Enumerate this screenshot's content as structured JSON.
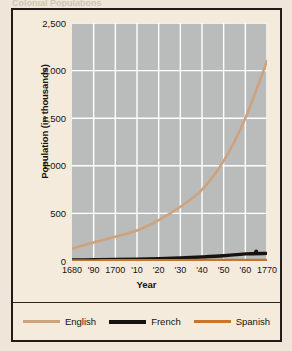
{
  "figure": {
    "cut_title": "Colonial Populations",
    "xlabel": "Year",
    "ylabel": "Population (in thousands)"
  },
  "colors": {
    "english": "#cfa27e",
    "french": "#17120e",
    "spanish": "#c4762f",
    "plot_bg": "#b9bcbb",
    "page_bg": "#f4ebdd",
    "grid": "#ffffff",
    "border": "#211c18"
  },
  "legend": {
    "items": [
      {
        "label": "English",
        "color": "#cfa27e",
        "thick": false
      },
      {
        "label": "French",
        "color": "#17120e",
        "thick": true
      },
      {
        "label": "Spanish",
        "color": "#c4762f",
        "thick": false
      }
    ]
  },
  "chart_data": {
    "type": "line",
    "title": "Colonial Populations",
    "xlabel": "Year",
    "ylabel": "Population (in thousands)",
    "xlim": [
      1680,
      1770
    ],
    "ylim": [
      0,
      2500
    ],
    "yticks": [
      2500,
      2000,
      1500,
      1000,
      500,
      0
    ],
    "ytick_labels": [
      "2,500",
      "2,000",
      "1,500",
      "1,000",
      "500",
      "0"
    ],
    "xticks": [
      1680,
      1690,
      1700,
      1710,
      1720,
      1730,
      1740,
      1750,
      1760,
      1770
    ],
    "xtick_labels": [
      "1680",
      "'90",
      "1700",
      "'10",
      "'20",
      "'30",
      "'40",
      "'50",
      "'60",
      "1770"
    ],
    "grid": true,
    "legend_position": "bottom",
    "x": [
      1680,
      1690,
      1700,
      1710,
      1720,
      1730,
      1740,
      1750,
      1760,
      1770
    ],
    "series": [
      {
        "name": "English",
        "color": "#cfa27e",
        "values": [
          130,
          195,
          255,
          320,
          430,
          570,
          750,
          1050,
          1500,
          2100
        ]
      },
      {
        "name": "French",
        "color": "#17120e",
        "values": [
          10,
          13,
          16,
          20,
          25,
          32,
          42,
          55,
          75,
          80
        ]
      },
      {
        "name": "Spanish",
        "color": "#c4762f",
        "values": [
          6,
          6,
          7,
          7,
          8,
          8,
          9,
          9,
          10,
          10
        ]
      }
    ],
    "annotations": [
      {
        "name": "french-endpoint-marker",
        "x": 1765,
        "y": 100,
        "shape": "dot",
        "color": "#17120e"
      }
    ]
  }
}
